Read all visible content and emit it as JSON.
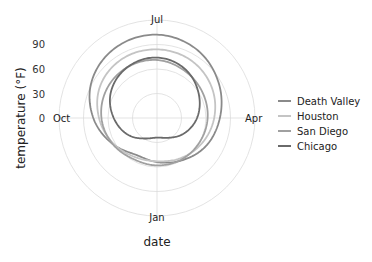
{
  "chart_data": {
    "type": "line",
    "subtype": "polar",
    "title": "",
    "xlabel": "date",
    "ylabel": "temperature (°F)",
    "angle_labels": [
      "Jan",
      "Apr",
      "Jul",
      "Oct"
    ],
    "angle_direction": "counterclockwise, Jan at bottom",
    "categories": [
      "Jan",
      "Feb",
      "Mar",
      "Apr",
      "May",
      "Jun",
      "Jul",
      "Aug",
      "Sep",
      "Oct",
      "Nov",
      "Dec"
    ],
    "radial_ticks": [
      0,
      30,
      60,
      90
    ],
    "radial_gridlines": [
      30,
      60,
      90,
      120
    ],
    "ylim": [
      0,
      120
    ],
    "grid": true,
    "legend_position": "right",
    "series": [
      {
        "name": "Death Valley",
        "color": "#8a8a8a",
        "values": [
          54,
          60,
          69,
          77,
          87,
          97,
          102,
          100,
          92,
          78,
          63,
          52
        ]
      },
      {
        "name": "Houston",
        "color": "#c4c4c4",
        "values": [
          53,
          57,
          63,
          70,
          77,
          82,
          84,
          84,
          80,
          71,
          62,
          55
        ]
      },
      {
        "name": "San Diego",
        "color": "#a0a0a0",
        "values": [
          58,
          59,
          60,
          62,
          64,
          67,
          71,
          72,
          71,
          68,
          63,
          58
        ]
      },
      {
        "name": "Chicago",
        "color": "#6a6a6a",
        "values": [
          24,
          28,
          38,
          49,
          59,
          69,
          74,
          72,
          65,
          53,
          41,
          29
        ]
      }
    ]
  },
  "labels": {
    "xlabel": "date",
    "ylabel": "temperature (°F)",
    "months": {
      "jan": "Jan",
      "apr": "Apr",
      "jul": "Jul",
      "oct": "Oct"
    },
    "ticks": [
      "0",
      "30",
      "60",
      "90"
    ],
    "legend": [
      "Death Valley",
      "Houston",
      "San Diego",
      "Chicago"
    ]
  }
}
